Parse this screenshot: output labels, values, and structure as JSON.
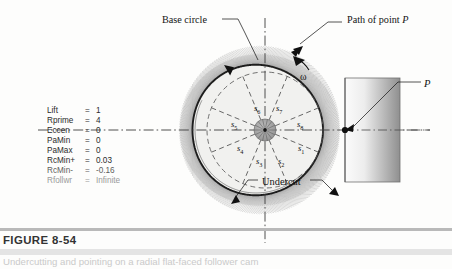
{
  "figure": {
    "caption_label": "FIGURE 8-54",
    "caption_text": "Undercutting and pointing on a radial flat-faced follower cam"
  },
  "parameters": {
    "title": "cam-parameter-list",
    "rows": [
      {
        "name": "Lift",
        "eq": "=",
        "value": "1",
        "style": "normal"
      },
      {
        "name": "Rprime",
        "eq": "=",
        "value": "4",
        "style": "normal"
      },
      {
        "name": "Eccen",
        "eq": "=",
        "value": "0",
        "style": "normal"
      },
      {
        "name": "PaMin",
        "eq": "=",
        "value": "0",
        "style": "normal"
      },
      {
        "name": "PaMax",
        "eq": "=",
        "value": "0",
        "style": "normal"
      },
      {
        "name": "RcMin+",
        "eq": "=",
        "value": "0.03",
        "style": "normal"
      },
      {
        "name": "RcMin-",
        "eq": "=",
        "value": "-0.16",
        "style": "semi"
      },
      {
        "name": "Rfollwr",
        "eq": "=",
        "value": "Infinite",
        "style": "dim"
      }
    ]
  },
  "annotations": {
    "base_circle": "Base circle",
    "path_of_point": "Path of point P",
    "path_of_point_prefix": "Path of point ",
    "path_of_point_italic": "P",
    "undercut": "Undercut",
    "point_p": "P",
    "omega": "ω"
  },
  "station_labels": [
    {
      "id": "s1",
      "base": "s",
      "sub": "1",
      "x": 298,
      "y": 143
    },
    {
      "id": "s2",
      "base": "s",
      "sub": "2",
      "x": 278,
      "y": 156
    },
    {
      "id": "s3",
      "base": "s",
      "sub": "3",
      "x": 256,
      "y": 156
    },
    {
      "id": "s4",
      "base": "s",
      "sub": "4",
      "x": 237,
      "y": 143
    },
    {
      "id": "s5",
      "base": "s",
      "sub": "5",
      "x": 231,
      "y": 119
    },
    {
      "id": "s6",
      "base": "s",
      "sub": "6",
      "x": 254,
      "y": 103
    },
    {
      "id": "s7",
      "base": "s",
      "sub": "7",
      "x": 276,
      "y": 103
    },
    {
      "id": "s8",
      "base": "s",
      "sub": "8",
      "x": 297,
      "y": 119
    }
  ],
  "colors": {
    "cam_fill": "#f1f1ef",
    "cam_outline": "#1d1d1d",
    "hatch": "#8d8d8d",
    "hub": "#9d9d9d",
    "follower_light": "#f2f2f2",
    "follower_dark": "#8e8e8e",
    "dash": "#4a4a4a",
    "caption_rule": "#b9b9b9"
  },
  "geometry": {
    "center_x": 265,
    "center_y": 130,
    "base_circle_r": 58,
    "cam_r": 70,
    "hub_r": 11,
    "spokes": 8,
    "follower_x": 345,
    "follower_y": 78,
    "follower_w": 55,
    "follower_h": 104
  }
}
